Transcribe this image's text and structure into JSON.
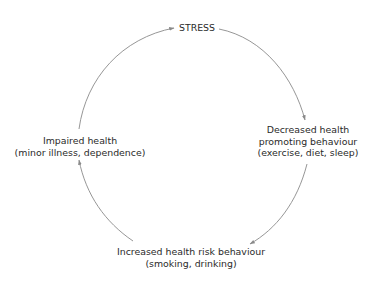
{
  "diagram": {
    "type": "cycle",
    "colors": {
      "text": "#2a2a2a",
      "arrow": "#8a8a8a",
      "background": "#ffffff"
    },
    "nodes": [
      {
        "id": "stress",
        "lines": [
          "STRESS"
        ]
      },
      {
        "id": "decreased",
        "lines": [
          "Decreased health",
          "promoting behaviour",
          "(exercise, diet, sleep)"
        ]
      },
      {
        "id": "increased",
        "lines": [
          "Increased health risk behaviour",
          "(smoking, drinking)"
        ]
      },
      {
        "id": "impaired",
        "lines": [
          "Impaired health",
          "(minor illness, dependence)"
        ]
      }
    ],
    "edges": [
      {
        "from": "stress",
        "to": "decreased"
      },
      {
        "from": "decreased",
        "to": "increased"
      },
      {
        "from": "increased",
        "to": "impaired"
      },
      {
        "from": "impaired",
        "to": "stress"
      }
    ]
  }
}
